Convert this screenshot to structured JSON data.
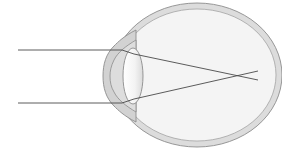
{
  "diagram": {
    "colors": {
      "background": "#ffffff",
      "sclera_fill": "#dcdcdc",
      "sclera_stroke": "#8c8c8c",
      "interior_fill": "#f4f4f4",
      "cornea_fill": "#cfcfcf",
      "lens_fill": "#f7f7f7",
      "ray_stroke": "#4a4a4a"
    },
    "rays": [
      {
        "from": [
          18,
          50
        ],
        "to_cornea": [
          122,
          50
        ],
        "to_lens": [
          134,
          54
        ],
        "end": [
          258,
          80
        ]
      },
      {
        "from": [
          18,
          103
        ],
        "to_cornea": [
          122,
          103
        ],
        "to_lens": [
          134,
          99
        ],
        "end": [
          258,
          71
        ]
      }
    ],
    "focal_point": [
      244,
      76
    ]
  }
}
